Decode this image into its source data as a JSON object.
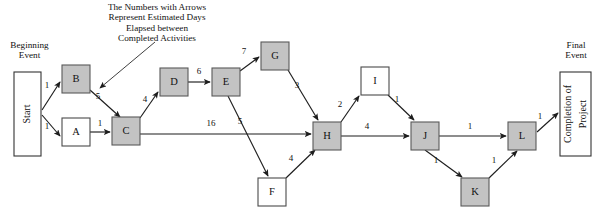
{
  "diagram": {
    "title_note": [
      "The Numbers with Arrows",
      "Represent Estimated Days",
      "Elapsed between",
      "Completed Activities"
    ],
    "beginning_event_label": [
      "Beginning",
      "Event"
    ],
    "final_event_label": [
      "Final",
      "Event"
    ],
    "start_box_text": "Start",
    "end_box_text": "Completion of Project",
    "end_box_text_line1": "Completion of",
    "end_box_text_line2": "Project",
    "colors": {
      "shaded_node_fill": "#c3c3c3",
      "shaded_node_stroke": "#595959",
      "plain_node_fill": "#ffffff",
      "plain_node_stroke": "#4a4a4a",
      "edge_stroke": "#1d1d1d",
      "text": "#111111",
      "background": "#ffffff"
    },
    "nodes": [
      {
        "id": "Start",
        "label": "Start",
        "shaded": false,
        "shape": "event",
        "x": 14,
        "y": 72,
        "w": 27,
        "h": 84
      },
      {
        "id": "B",
        "label": "B",
        "shaded": true,
        "shape": "box",
        "x": 62,
        "y": 65,
        "w": 28,
        "h": 28
      },
      {
        "id": "A",
        "label": "A",
        "shaded": false,
        "shape": "box",
        "x": 62,
        "y": 118,
        "w": 28,
        "h": 28
      },
      {
        "id": "C",
        "label": "C",
        "shaded": true,
        "shape": "box",
        "x": 112,
        "y": 117,
        "w": 28,
        "h": 28
      },
      {
        "id": "D",
        "label": "D",
        "shaded": true,
        "shape": "box",
        "x": 160,
        "y": 68,
        "w": 28,
        "h": 28
      },
      {
        "id": "E",
        "label": "E",
        "shaded": true,
        "shape": "box",
        "x": 212,
        "y": 68,
        "w": 28,
        "h": 28
      },
      {
        "id": "G",
        "label": "G",
        "shaded": true,
        "shape": "box",
        "x": 261,
        "y": 42,
        "w": 28,
        "h": 28
      },
      {
        "id": "F",
        "label": "F",
        "shaded": false,
        "shape": "box",
        "x": 258,
        "y": 178,
        "w": 28,
        "h": 28
      },
      {
        "id": "H",
        "label": "H",
        "shaded": true,
        "shape": "box",
        "x": 313,
        "y": 122,
        "w": 28,
        "h": 28
      },
      {
        "id": "I",
        "label": "I",
        "shaded": false,
        "shape": "box",
        "x": 361,
        "y": 67,
        "w": 28,
        "h": 28
      },
      {
        "id": "J",
        "label": "J",
        "shaded": true,
        "shape": "box",
        "x": 411,
        "y": 122,
        "w": 28,
        "h": 28
      },
      {
        "id": "K",
        "label": "K",
        "shaded": true,
        "shape": "box",
        "x": 461,
        "y": 178,
        "w": 28,
        "h": 28
      },
      {
        "id": "L",
        "label": "L",
        "shaded": true,
        "shape": "box",
        "x": 508,
        "y": 122,
        "w": 28,
        "h": 28
      },
      {
        "id": "End",
        "label": "Completion of Project",
        "shaded": false,
        "shape": "event",
        "x": 560,
        "y": 72,
        "w": 31,
        "h": 84
      }
    ],
    "edges": [
      {
        "from": "Start",
        "to": "B",
        "label": "1",
        "x1": 42,
        "y1": 110,
        "x2": 60,
        "y2": 82,
        "lx": 47,
        "ly": 86
      },
      {
        "from": "Start",
        "to": "A",
        "label": "1",
        "x1": 42,
        "y1": 115,
        "x2": 60,
        "y2": 136,
        "lx": 47,
        "ly": 127
      },
      {
        "from": "B",
        "to": "C",
        "label": "5",
        "x1": 90,
        "y1": 90,
        "x2": 120,
        "y2": 117,
        "lx": 98,
        "ly": 97
      },
      {
        "from": "A",
        "to": "C",
        "label": "1",
        "x1": 90,
        "y1": 132,
        "x2": 110,
        "y2": 132,
        "lx": 100,
        "ly": 124
      },
      {
        "from": "C",
        "to": "D",
        "label": "4",
        "x1": 140,
        "y1": 118,
        "x2": 158,
        "y2": 92,
        "lx": 145,
        "ly": 100
      },
      {
        "from": "D",
        "to": "E",
        "label": "6",
        "x1": 188,
        "y1": 82,
        "x2": 210,
        "y2": 82,
        "lx": 199,
        "ly": 72
      },
      {
        "from": "E",
        "to": "G",
        "label": "7",
        "x1": 240,
        "y1": 71,
        "x2": 259,
        "y2": 57,
        "lx": 244,
        "ly": 52
      },
      {
        "from": "G",
        "to": "H",
        "label": "3",
        "x1": 288,
        "y1": 70,
        "x2": 318,
        "y2": 120,
        "lx": 297,
        "ly": 86
      },
      {
        "from": "C",
        "to": "H",
        "label": "16",
        "x1": 140,
        "y1": 134,
        "x2": 311,
        "y2": 134,
        "lx": 211,
        "ly": 124
      },
      {
        "from": "E",
        "to": "F",
        "label": "5",
        "x1": 228,
        "y1": 96,
        "x2": 268,
        "y2": 176,
        "lx": 240,
        "ly": 122
      },
      {
        "from": "F",
        "to": "H",
        "label": "4",
        "x1": 286,
        "y1": 178,
        "x2": 315,
        "y2": 150,
        "lx": 291,
        "ly": 159
      },
      {
        "from": "H",
        "to": "I",
        "label": "2",
        "x1": 341,
        "y1": 122,
        "x2": 359,
        "y2": 96,
        "lx": 340,
        "ly": 105
      },
      {
        "from": "I",
        "to": "J",
        "label": "1",
        "x1": 388,
        "y1": 95,
        "x2": 414,
        "y2": 120,
        "lx": 397,
        "ly": 100
      },
      {
        "from": "H",
        "to": "J",
        "label": "4",
        "x1": 341,
        "y1": 136,
        "x2": 409,
        "y2": 136,
        "lx": 367,
        "ly": 127
      },
      {
        "from": "J",
        "to": "L",
        "label": "1",
        "x1": 439,
        "y1": 136,
        "x2": 506,
        "y2": 136,
        "lx": 470,
        "ly": 127
      },
      {
        "from": "J",
        "to": "K",
        "label": "1",
        "x1": 425,
        "y1": 150,
        "x2": 462,
        "y2": 177,
        "lx": 436,
        "ly": 161
      },
      {
        "from": "K",
        "to": "L",
        "label": "1",
        "x1": 489,
        "y1": 178,
        "x2": 517,
        "y2": 151,
        "lx": 494,
        "ly": 161
      },
      {
        "from": "L",
        "to": "End",
        "label": "1",
        "x1": 537,
        "y1": 132,
        "x2": 558,
        "y2": 113,
        "lx": 540,
        "ly": 117
      }
    ],
    "leader": {
      "x1": 155,
      "y1": 42,
      "x2": 100,
      "y2": 88
    }
  }
}
